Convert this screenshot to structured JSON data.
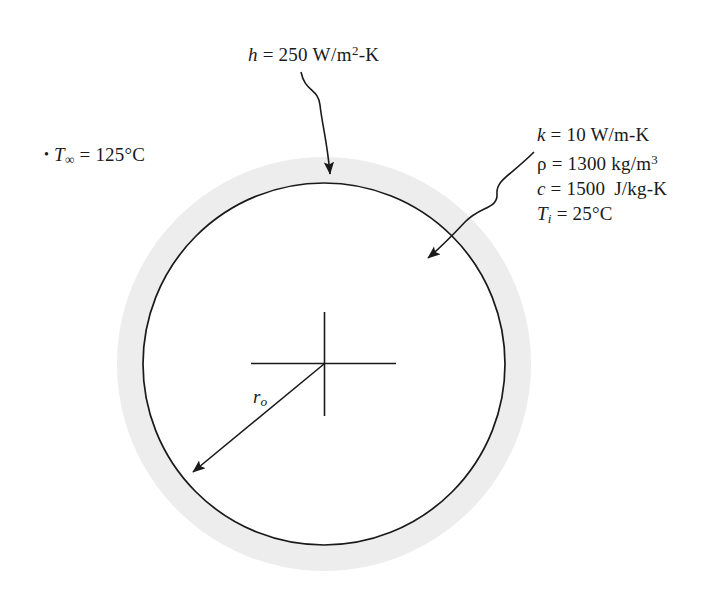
{
  "figure": {
    "name": "transient-conduction-sphere-diagram",
    "background_color": "#ffffff"
  },
  "geometry": {
    "center_x": 324,
    "center_y": 364,
    "inner_radius": 181,
    "outer_radius": 207,
    "shade_color": "#ededed",
    "line_color": "#1a1a1a"
  },
  "labels": {
    "convection": {
      "symbol": "h",
      "equals": "=",
      "value": "250",
      "unit_pre": "W/m",
      "unit_sup": "2",
      "unit_post": "-K",
      "full_text": "h = 250 W/m2-K"
    },
    "ambient_temp": {
      "bullet": "•",
      "symbol": "T",
      "subscript": "∞",
      "equals": "=",
      "value": "125°C",
      "full_text": "T∞ = 125°C"
    },
    "properties": [
      {
        "symbol": "k",
        "equals": "=",
        "value": "10",
        "unit_pre": "W/m-K",
        "unit_sup": "",
        "unit_post": "",
        "full_text": "k = 10 W/m-K"
      },
      {
        "symbol": "ρ",
        "equals": "=",
        "value": "1300",
        "unit_pre": "kg/m",
        "unit_sup": "3",
        "unit_post": "",
        "full_text": "ρ = 1300 kg/m3"
      },
      {
        "symbol": "c",
        "equals": "=",
        "value": "1500",
        "unit_pre": "J/kg-K",
        "unit_sup": "",
        "unit_post": "",
        "full_text": "c = 1500 J/kg-K"
      },
      {
        "symbol": "T",
        "subscript": "i",
        "equals": "=",
        "value": "25°C",
        "unit_pre": "",
        "unit_sup": "",
        "unit_post": "",
        "full_text": "Ti = 25°C"
      }
    ],
    "radius": {
      "symbol": "r",
      "subscript": "o",
      "full_text": "ro"
    }
  }
}
